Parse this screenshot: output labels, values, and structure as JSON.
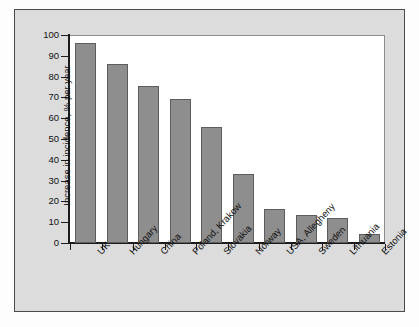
{
  "chart_data": {
    "type": "bar",
    "title": "",
    "subtitle": "",
    "xlabel": "",
    "ylabel": "Increase in incidence, % per year",
    "ylim": [
      0,
      100
    ],
    "ytick_step": 10,
    "yticks": [
      "100",
      "90",
      "80",
      "70",
      "60",
      "50",
      "40",
      "30",
      "20",
      "10",
      "0"
    ],
    "grid": false,
    "legend": false,
    "legend_position": "none",
    "orientation": "vertical",
    "categories": [
      "UK",
      "Hungary",
      "China",
      "Poland, Krakow",
      "Slovakia",
      "Norway",
      "USA, Allegheny",
      "Sweden",
      "Lithuania",
      "Estonia"
    ],
    "values": [
      96,
      86,
      75.5,
      69,
      56,
      33,
      16.5,
      13.5,
      12,
      4.5
    ],
    "bar_color": "#8e8e8e",
    "bar_edge_color": "#5d5d5d",
    "axis_color": "#1c1c1c",
    "plot_background": "#ffffff",
    "panel_background": "#dcdcdc",
    "page_background": "#fdfdfd"
  }
}
